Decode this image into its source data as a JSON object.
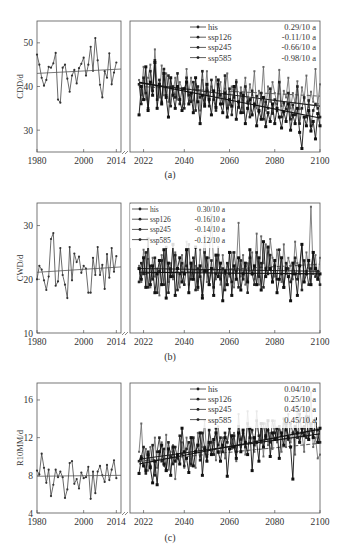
{
  "chart_data": [
    {
      "id": "a",
      "type": "line",
      "caption": "(a)",
      "ylabel": "CDD/d",
      "ylim": [
        25,
        55
      ],
      "yticks": [
        30,
        40,
        50
      ],
      "xticks_left": [
        1980,
        2000,
        2014
      ],
      "xticks_right": [
        2022,
        2040,
        2060,
        2080,
        2100
      ],
      "legend": [
        {
          "name": "his",
          "trend": "0.29/10 a"
        },
        {
          "name": "ssp126",
          "trend": "-0.11/10 a"
        },
        {
          "name": "ssp245",
          "trend": "-0.66/10 a"
        },
        {
          "name": "ssp585",
          "trend": "-0.98/10 a"
        }
      ],
      "his": {
        "x_start": 1980,
        "values": [
          47.3,
          45,
          42,
          40.2,
          41.5,
          44.5,
          44.3,
          45.3,
          47.7,
          37,
          36.3,
          44.3,
          45,
          41.8,
          38.8,
          42.5,
          43.8,
          40.7,
          44.2,
          45.2,
          46.6,
          42.5,
          45,
          49.1,
          43.6,
          51.1,
          46,
          40.4,
          37.5,
          43.5,
          42,
          47.6,
          40.5,
          43.2,
          45.5
        ],
        "trend": [
          43.0,
          44.0
        ]
      },
      "scenarios": [
        {
          "name": "ssp126",
          "trend": [
            40.0,
            37.8
          ],
          "values": [
            41.5,
            38,
            44.5,
            37,
            42,
            45,
            39,
            48.5,
            40,
            37.5,
            44.8,
            38,
            43,
            36.5,
            40,
            38.5,
            42,
            37,
            41,
            39.5,
            36,
            44,
            38.5,
            42,
            36.8,
            40.5,
            39.2,
            34.5,
            41.5,
            37,
            43.5,
            36.5,
            40,
            38,
            42.2,
            37.5,
            41,
            36,
            39.5,
            43,
            35.8,
            40,
            38,
            41.5,
            35.2,
            39.8,
            37.5,
            42,
            36,
            40.5,
            38,
            43.5,
            35,
            39,
            37,
            44.5,
            34.5,
            40,
            36.5,
            41,
            38.5,
            36,
            43.8,
            35.5,
            39,
            37.5,
            42,
            35,
            38.5,
            36.3,
            41.2,
            34.8,
            39.8,
            37.2,
            42.5,
            35.2,
            38.8,
            36.5,
            44,
            36,
            40.5
          ]
        },
        {
          "name": "ssp245",
          "trend": [
            40.8,
            35.5
          ],
          "values": [
            40.5,
            36,
            42,
            38.5,
            35,
            43.5,
            39,
            46,
            37,
            41.5,
            36.5,
            44,
            38,
            42.5,
            35.5,
            40,
            37.5,
            43,
            36,
            39.5,
            35,
            42,
            38,
            36.5,
            41,
            34.5,
            40,
            37.5,
            43.5,
            36,
            39,
            35.5,
            41.5,
            37,
            34.5,
            40.5,
            38,
            36,
            42.5,
            35,
            39.5,
            33.5,
            37.5,
            41,
            35.2,
            38.5,
            34,
            40,
            36.5,
            33,
            39,
            35.5,
            37.8,
            34.2,
            38.5,
            32.5,
            36.5,
            35,
            39.5,
            33.8,
            37,
            34.5,
            41,
            33,
            36.2,
            34.8,
            38.5,
            32.5,
            35.8,
            33.5,
            40,
            31.5,
            35,
            37.5,
            33,
            36.8,
            31,
            34.5,
            36,
            35,
            33
          ]
        },
        {
          "name": "ssp585",
          "trend": [
            41.0,
            32.8
          ],
          "values": [
            33.5,
            40,
            37,
            44.5,
            34.5,
            41,
            38,
            45.5,
            35,
            40.5,
            36,
            43,
            37.5,
            33,
            42,
            38,
            35,
            40,
            37,
            34.5,
            39.5,
            41,
            36,
            38.5,
            34,
            42,
            36.5,
            31.5,
            38,
            35.5,
            40.5,
            37,
            33.5,
            39,
            35.2,
            41.5,
            36,
            34,
            38.5,
            33,
            37,
            35.5,
            40,
            32.5,
            36.5,
            34,
            38,
            31.5,
            35,
            37,
            33.5,
            36,
            31,
            34.5,
            32.5,
            37.5,
            30.8,
            34,
            32,
            36,
            31.5,
            35,
            33,
            30.5,
            34.2,
            32,
            36,
            30,
            33.5,
            31.5,
            35,
            29.5,
            25.8,
            33,
            31,
            34.5,
            29.8,
            32,
            28,
            33.8,
            31
          ]
        }
      ]
    },
    {
      "id": "b",
      "type": "line",
      "caption": "(b)",
      "ylabel": "CWD/d",
      "ylim": [
        10,
        34.2
      ],
      "yticks": [
        10,
        20,
        30
      ],
      "xticks_left": [
        1980,
        2000,
        2014
      ],
      "xticks_right": [
        2022,
        2040,
        2060,
        2080,
        2100
      ],
      "legend": [
        {
          "name": "his",
          "trend": "0.30/10 a"
        },
        {
          "name": "ssp126",
          "trend": "-0.16/10 a"
        },
        {
          "name": "ssp245",
          "trend": "-0.14/10 a"
        },
        {
          "name": "ssp585",
          "trend": "-0.12/10 a"
        }
      ],
      "his": {
        "x_start": 1980,
        "values": [
          20,
          22.5,
          21.8,
          19.8,
          18,
          20.5,
          27.5,
          28.6,
          18.8,
          19.6,
          25.8,
          20.8,
          19,
          16.5,
          26,
          19.8,
          24.8,
          23.2,
          24.2,
          21.2,
          22.5,
          22,
          17.5,
          17.5,
          24,
          20.8,
          26,
          20.8,
          22.7,
          18.2,
          24.7,
          20.3,
          25.8,
          21.4,
          24.3
        ],
        "trend": [
          21.3,
          22.3
        ]
      },
      "scenarios": [
        {
          "name": "ssp126",
          "trend": [
            21.0,
            22.8
          ],
          "values": [
            22.5,
            19.5,
            25.5,
            21,
            23.8,
            18.5,
            24,
            20.5,
            22,
            17,
            24.5,
            21.5,
            26,
            19.5,
            23,
            20,
            25,
            22,
            18.5,
            24.5,
            21,
            27,
            19,
            23,
            20.5,
            22.5,
            18,
            25.5,
            21.5,
            28,
            19.5,
            24,
            32,
            22,
            20,
            26,
            19,
            24.5,
            21,
            23,
            20.5,
            25,
            18.5,
            22,
            30.5,
            20.5,
            24.5,
            19,
            23,
            21.5,
            25,
            20,
            28.5,
            19,
            28,
            23,
            26.5,
            21,
            27.5,
            24,
            20.5,
            25.5,
            22,
            19.5,
            26.5,
            21,
            24,
            22.5,
            20,
            27,
            23,
            21,
            26.5,
            19.5,
            25,
            22,
            33.5,
            21,
            24.5,
            20,
            24
          ]
        },
        {
          "name": "ssp245",
          "trend": [
            22.0,
            21.5
          ],
          "values": [
            19.5,
            23,
            21,
            25,
            18.5,
            22.5,
            20,
            24,
            17.5,
            21.5,
            23.5,
            19,
            26,
            17.5,
            22,
            20.5,
            24.5,
            18,
            21,
            23,
            19,
            22.5,
            26.5,
            20,
            24,
            18,
            22,
            20.5,
            17,
            25,
            21.5,
            19,
            23.5,
            18.5,
            21,
            24.5,
            20,
            22,
            18,
            23,
            21,
            19.5,
            25,
            21.5,
            18.5,
            23.5,
            20,
            22.5,
            17.5,
            24,
            21,
            19,
            25,
            20.5,
            23,
            18.5,
            22,
            21,
            24.5,
            19.5,
            22.5,
            20,
            25.5,
            21,
            18.5,
            23,
            22,
            19.5,
            21,
            24,
            20,
            22.5,
            18,
            23.5,
            21.5,
            19,
            22,
            25,
            20.5,
            21.5,
            19
          ]
        },
        {
          "name": "ssp585",
          "trend": [
            21.3,
            21.0
          ],
          "values": [
            22,
            20,
            24,
            18.5,
            27.5,
            19,
            22.5,
            17.5,
            21,
            23.5,
            19,
            25.5,
            16.5,
            23,
            20.5,
            26.5,
            17,
            22,
            24,
            19.5,
            21,
            25.5,
            17.5,
            23,
            20,
            26,
            18.5,
            22.5,
            16.5,
            21.5,
            24,
            19,
            22,
            17,
            24.5,
            20.5,
            23,
            16,
            21.5,
            19,
            25,
            17,
            22.5,
            20,
            24,
            18,
            21,
            23,
            19.5,
            25.5,
            21,
            22.5,
            19,
            24,
            18,
            27,
            20.5,
            26,
            22,
            19.5,
            23.5,
            17.5,
            20,
            24,
            18.5,
            22,
            20.5,
            16,
            23,
            21,
            17,
            22.5,
            26.5,
            19.5,
            21,
            23.5,
            19,
            25,
            22,
            20,
            21
          ]
        }
      ]
    },
    {
      "id": "c",
      "type": "line",
      "caption": "(c)",
      "ylabel": "R10MM/d",
      "ylim": [
        4,
        17.8
      ],
      "yticks": [
        4,
        8,
        12,
        16
      ],
      "xticks_left": [
        1980,
        2000,
        2014
      ],
      "xticks_right": [
        2022,
        2040,
        2060,
        2080,
        2100
      ],
      "legend": [
        {
          "name": "his",
          "trend": "0.04/10 a"
        },
        {
          "name": "ssp126",
          "trend": "0.25/10 a"
        },
        {
          "name": "ssp245",
          "trend": "0.45/10 a"
        },
        {
          "name": "ssp585",
          "trend": "0.45/10 a"
        }
      ],
      "his": {
        "x_start": 1980,
        "values": [
          8.5,
          8.1,
          10.3,
          8.8,
          7.2,
          8.6,
          5.8,
          7,
          8.6,
          7.8,
          8.4,
          7.8,
          5.6,
          6.5,
          9.3,
          9.5,
          7.1,
          7.6,
          6.6,
          8.3,
          7.7,
          7.8,
          8.9,
          5.5,
          8.4,
          6.1,
          8.4,
          9,
          8,
          7.3,
          9.1,
          7.5,
          8.6,
          9.6,
          7.7
        ],
        "trend": [
          7.9,
          8.0
        ]
      },
      "scenarios": [
        {
          "name": "ssp126",
          "trend": [
            9.5,
            11.4
          ],
          "values": [
            10.5,
            13.5,
            9.2,
            10.8,
            8.5,
            11,
            9.5,
            12,
            8.8,
            10.2,
            11.5,
            9,
            12.3,
            8.6,
            10.5,
            11.2,
            7.6,
            10,
            9.2,
            11.5,
            8.8,
            12,
            10.3,
            9,
            11.8,
            8.8,
            12.5,
            10,
            11,
            13.8,
            9.6,
            12.8,
            10.2,
            11.5,
            9.6,
            13.2,
            10.5,
            12,
            9.8,
            11.5,
            13,
            10.8,
            12.5,
            9.5,
            14.5,
            11,
            12.8,
            10.2,
            14.8,
            11.5,
            12,
            10.5,
            14.8,
            11.8,
            13,
            10,
            13.5,
            11.2,
            12.5,
            10.8,
            13.8,
            11.5,
            12.8,
            10.5,
            13.5,
            11,
            14.5,
            11.5,
            12.5,
            10.2,
            15.4,
            11.5,
            12.5,
            10.5,
            14.8,
            11.8,
            16.8,
            11,
            12,
            9.8,
            10.2
          ]
        },
        {
          "name": "ssp245",
          "trend": [
            9.7,
            12.4
          ],
          "values": [
            9.5,
            10,
            11,
            8.2,
            10.5,
            9,
            11.2,
            8,
            10.5,
            12,
            9.5,
            10.8,
            8.5,
            11.5,
            10,
            9.2,
            11,
            9.8,
            12.2,
            10.3,
            9,
            10.8,
            11.5,
            9.2,
            12,
            10.5,
            11.2,
            9.6,
            12.5,
            11,
            10,
            12.8,
            11.5,
            10.2,
            13,
            11.2,
            12,
            10.5,
            12.5,
            11.5,
            13,
            11,
            12.2,
            10.5,
            13.2,
            11.8,
            12.5,
            11,
            13.5,
            12,
            12.8,
            11.2,
            13.8,
            12.2,
            11.5,
            13.5,
            12,
            12.8,
            11.5,
            13.8,
            12.5,
            11.8,
            13.2,
            12.2,
            14,
            12.8,
            11.8,
            13.5,
            12.5,
            13,
            12,
            14.5,
            12.5,
            13.2,
            12,
            14.2,
            13,
            12,
            13.5,
            12.8,
            11.5
          ]
        },
        {
          "name": "ssp585",
          "trend": [
            9.2,
            12.9
          ],
          "values": [
            8.2,
            9.8,
            9,
            8.5,
            10.2,
            8.8,
            7.2,
            9.5,
            7,
            10.5,
            11.2,
            9.2,
            8.5,
            10.8,
            8,
            11,
            9.5,
            10.2,
            9.2,
            13,
            10.5,
            9.8,
            8.3,
            12,
            9,
            10.5,
            11.2,
            12.5,
            8,
            10.8,
            9.5,
            11.5,
            10.2,
            11.8,
            12.5,
            10.5,
            9.5,
            11.2,
            12,
            7.9,
            10.8,
            12.2,
            11,
            9.8,
            12.5,
            10.5,
            12.8,
            11.5,
            10.2,
            13,
            8.5,
            12,
            11.5,
            9.5,
            13.5,
            11,
            12.2,
            13.8,
            10,
            12.5,
            11.8,
            13,
            9.8,
            12.5,
            11.2,
            13.5,
            12,
            11,
            7.6,
            13.2,
            12.5,
            11.5,
            13,
            12.2,
            14.2,
            11.8,
            13.5,
            12,
            14,
            11.5,
            13
          ]
        }
      ]
    }
  ],
  "figure": {
    "colors": {
      "axis": "#555555",
      "line_light": "#666666",
      "line_dark": "#222222",
      "text": "#333333"
    }
  }
}
